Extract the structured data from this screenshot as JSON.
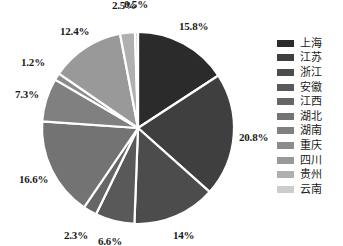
{
  "chart_data": {
    "type": "pie",
    "title": "",
    "subtitle": "",
    "xlabel": "",
    "ylabel": "",
    "grid": false,
    "legend_position": "right",
    "start_angle_deg": 0,
    "direction": "clockwise",
    "categories": [
      "上海",
      "江苏",
      "浙江",
      "安徽",
      "江西",
      "湖北",
      "湖南",
      "重庆",
      "四川",
      "贵州",
      "云南"
    ],
    "values": [
      15.8,
      20.8,
      14.0,
      6.6,
      2.3,
      16.6,
      7.3,
      1.2,
      12.4,
      2.5,
      0.5
    ],
    "data_labels": [
      "15.8%",
      "20.8%",
      "14%",
      "6.6%",
      "2.3%",
      "16.6%",
      "7.3%",
      "1.2%",
      "12.4%",
      "2.5%",
      "0.5%"
    ],
    "colors": [
      "#2b2b2b",
      "#3f3f3f",
      "#4c4c4c",
      "#595959",
      "#666666",
      "#737373",
      "#808080",
      "#8c8c8c",
      "#999999",
      "#b0b0b0",
      "#cccccc"
    ],
    "slice_border_color": "#ffffff"
  },
  "legend": {
    "items": [
      {
        "label": "上海",
        "color": "#2b2b2b"
      },
      {
        "label": "江苏",
        "color": "#3f3f3f"
      },
      {
        "label": "浙江",
        "color": "#4c4c4c"
      },
      {
        "label": "安徽",
        "color": "#595959"
      },
      {
        "label": "江西",
        "color": "#666666"
      },
      {
        "label": "湖北",
        "color": "#737373"
      },
      {
        "label": "湖南",
        "color": "#808080"
      },
      {
        "label": "重庆",
        "color": "#8c8c8c"
      },
      {
        "label": "四川",
        "color": "#999999"
      },
      {
        "label": "贵州",
        "color": "#b0b0b0"
      },
      {
        "label": "云南",
        "color": "#cccccc"
      }
    ]
  },
  "geometry": {
    "center_x": 138,
    "center_y": 128,
    "radius": 96,
    "label_radius": 116
  }
}
